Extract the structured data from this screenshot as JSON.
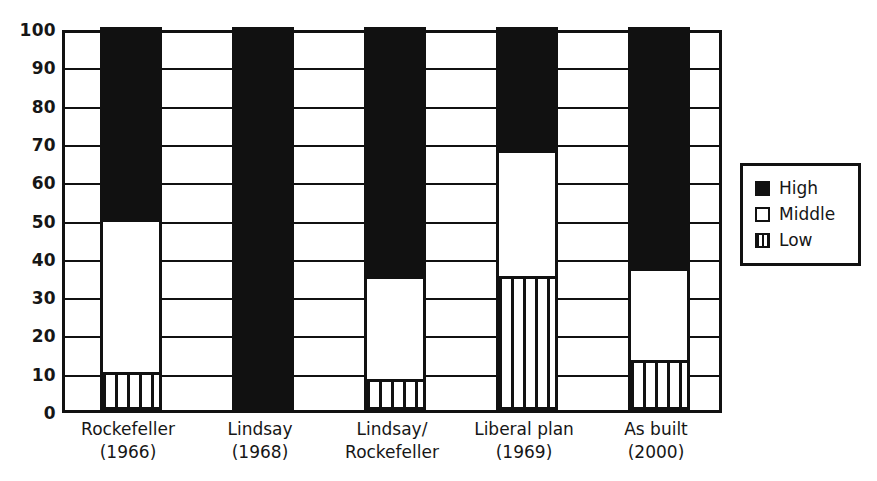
{
  "chart_data": {
    "type": "bar",
    "subtype": "stacked-bar-100",
    "title": "",
    "xlabel": "",
    "ylabel": "",
    "ylim": [
      0,
      100
    ],
    "yticks": [
      0,
      10,
      20,
      30,
      40,
      50,
      60,
      70,
      80,
      90,
      100
    ],
    "ytick_labels": [
      "0",
      "10",
      "20",
      "30",
      "40",
      "50",
      "60",
      "70",
      "80",
      "90",
      "100"
    ],
    "grid": true,
    "grid_axis": "y",
    "legend_position": "right",
    "categories": [
      {
        "line1": "Rockefeller",
        "line2": "(1966)"
      },
      {
        "line1": "Lindsay",
        "line2": "(1968)"
      },
      {
        "line1": "Lindsay/",
        "line2": "Rockefeller"
      },
      {
        "line1": "Liberal plan",
        "line2": "(1969)"
      },
      {
        "line1": "As built",
        "line2": "(2000)"
      }
    ],
    "category_labels": [
      "Rockefeller (1966)",
      "Lindsay (1968)",
      "Lindsay/ Rockefeller",
      "Liberal plan (1969)",
      "As built (2000)"
    ],
    "series": [
      {
        "name": "Low",
        "fill": "vertical-stripes",
        "values": [
          10,
          0,
          8,
          35,
          13
        ]
      },
      {
        "name": "Middle",
        "fill": "white",
        "values": [
          40,
          0,
          27,
          33,
          24
        ]
      },
      {
        "name": "High",
        "fill": "black",
        "values": [
          50,
          100,
          65,
          32,
          63
        ]
      }
    ],
    "stack_tops": {
      "low": [
        10,
        0,
        8,
        35,
        13
      ],
      "middle": [
        50,
        0,
        35,
        68,
        37
      ],
      "high": [
        100,
        100,
        100,
        100,
        100
      ]
    },
    "colors": {
      "high": "#111111",
      "middle": "#ffffff",
      "low": "#ffffff",
      "stroke": "#111111",
      "background": "#ffffff"
    }
  },
  "legend": {
    "items": [
      {
        "label": "High",
        "pattern": "solid-black"
      },
      {
        "label": "Middle",
        "pattern": "empty-white"
      },
      {
        "label": "Low",
        "pattern": "vertical-stripes"
      }
    ]
  }
}
